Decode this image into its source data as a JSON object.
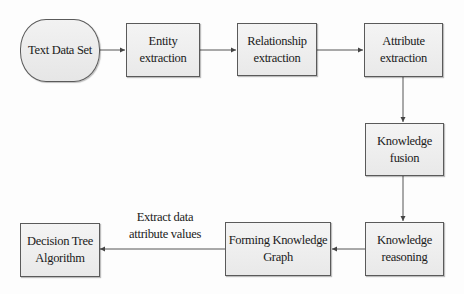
{
  "diagram": {
    "type": "flowchart",
    "colors": {
      "node_fill": "#eeeeee",
      "node_border": "#5a5a5a",
      "edge": "#555555",
      "text": "#1a1a1a",
      "background": "#ffffff"
    },
    "nodes": {
      "text_data_set": {
        "label": "Text Data Set",
        "shape": "rounded"
      },
      "entity_extraction": {
        "label": "Entity\nextraction",
        "shape": "rect"
      },
      "relationship_extraction": {
        "label": "Relationship\nextraction",
        "shape": "rect"
      },
      "attribute_extraction": {
        "label": "Attribute\nextraction",
        "shape": "rect"
      },
      "knowledge_fusion": {
        "label": "Knowledge\nfusion",
        "shape": "rect"
      },
      "knowledge_reasoning": {
        "label": "Knowledge\nreasoning",
        "shape": "rect"
      },
      "forming_knowledge_graph": {
        "label": "Forming Knowledge\nGraph",
        "shape": "rect"
      },
      "decision_tree_algorithm": {
        "label": "Decision Tree\nAlgorithm",
        "shape": "rect"
      }
    },
    "edges": [
      {
        "from": "text_data_set",
        "to": "entity_extraction",
        "label": ""
      },
      {
        "from": "entity_extraction",
        "to": "relationship_extraction",
        "label": ""
      },
      {
        "from": "relationship_extraction",
        "to": "attribute_extraction",
        "label": ""
      },
      {
        "from": "attribute_extraction",
        "to": "knowledge_fusion",
        "label": ""
      },
      {
        "from": "knowledge_fusion",
        "to": "knowledge_reasoning",
        "label": ""
      },
      {
        "from": "knowledge_reasoning",
        "to": "forming_knowledge_graph",
        "label": ""
      },
      {
        "from": "forming_knowledge_graph",
        "to": "decision_tree_algorithm",
        "label": "Extract data\nattribute values"
      }
    ],
    "edge_labels": {
      "extract_data": "Extract data\nattribute values"
    }
  }
}
